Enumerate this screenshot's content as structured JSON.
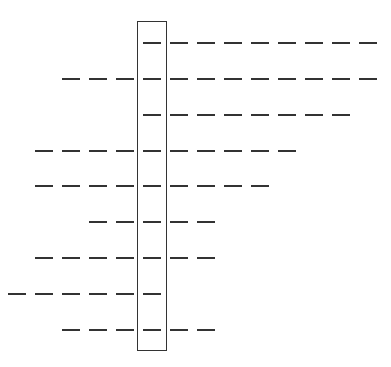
{
  "diagram": {
    "colors": {
      "line": "#333333",
      "background": "#ffffff"
    },
    "box": {
      "x": 137,
      "y": 21,
      "width": 30,
      "height": 330
    },
    "dash": {
      "length": 18,
      "pitch": 27,
      "inside_x": 143,
      "right_start_x": 170,
      "left_end_x": 134
    },
    "rows": [
      {
        "y": 43,
        "left": 0,
        "right": 8
      },
      {
        "y": 79,
        "left": 3,
        "right": 8
      },
      {
        "y": 115,
        "left": 0,
        "right": 7
      },
      {
        "y": 151,
        "left": 4,
        "right": 5
      },
      {
        "y": 186,
        "left": 4,
        "right": 4
      },
      {
        "y": 222,
        "left": 2,
        "right": 2
      },
      {
        "y": 258,
        "left": 4,
        "right": 2
      },
      {
        "y": 294,
        "left": 5,
        "right": 0
      },
      {
        "y": 330,
        "left": 3,
        "right": 2
      }
    ]
  }
}
